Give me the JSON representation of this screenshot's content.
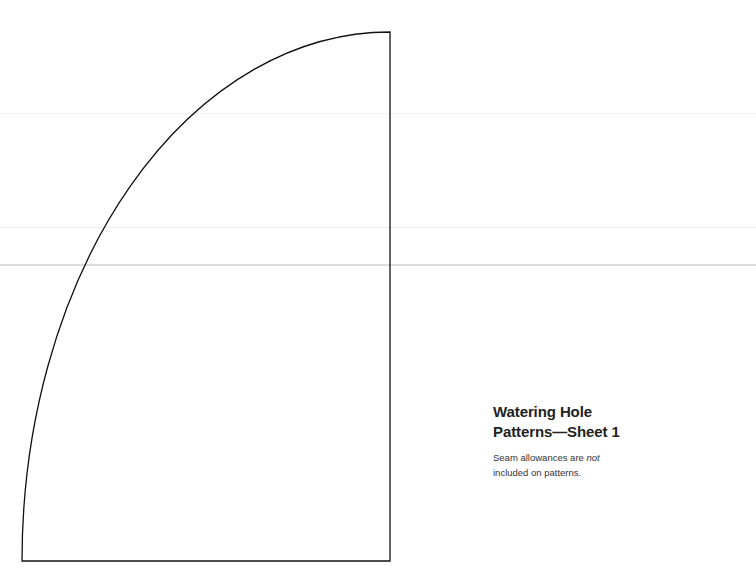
{
  "sheet": {
    "title_line1": "Watering Hole",
    "title_line2": "Patterns—Sheet 1",
    "note_prefix": "Seam allowances are ",
    "note_emphasis": "not",
    "note_line2": "included on patterns."
  },
  "pattern_piece": {
    "shape": "quarter-ellipse",
    "stroke_color": "#111111",
    "points": {
      "top_right": [
        390,
        32
      ],
      "bottom_right": [
        390,
        561
      ],
      "bottom_left": [
        22,
        561
      ]
    }
  },
  "colors": {
    "background": "#ffffff",
    "text": "#222222",
    "fold_line": "#dedede"
  }
}
